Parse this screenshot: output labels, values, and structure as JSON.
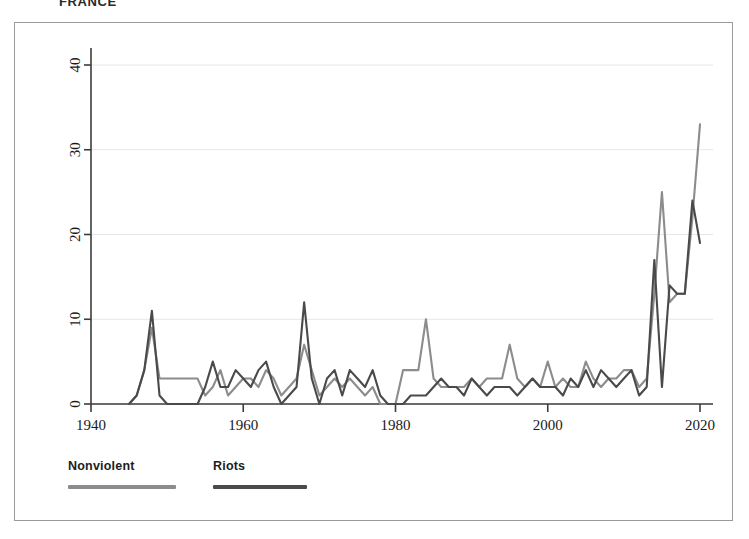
{
  "title": "FRANCE",
  "legend": {
    "items": [
      {
        "label": "Nonviolent",
        "color": "#8c8c8c"
      },
      {
        "label": "Riots",
        "color": "#4a4a4a"
      }
    ]
  },
  "axes": {
    "x_ticks": [
      "1940",
      "1960",
      "1980",
      "2000",
      "2020"
    ],
    "y_ticks": [
      "0",
      "10",
      "20",
      "30",
      "40"
    ]
  },
  "chart_data": {
    "type": "line",
    "title": "FRANCE",
    "xlabel": "",
    "ylabel": "",
    "xlim": [
      1940,
      2022
    ],
    "ylim": [
      0,
      43
    ],
    "grid": true,
    "legend_position": "below-plot-left",
    "x": [
      1945,
      1946,
      1947,
      1948,
      1949,
      1950,
      1951,
      1952,
      1953,
      1954,
      1955,
      1956,
      1957,
      1958,
      1959,
      1960,
      1961,
      1962,
      1963,
      1964,
      1965,
      1966,
      1967,
      1968,
      1969,
      1970,
      1971,
      1972,
      1973,
      1974,
      1975,
      1976,
      1977,
      1978,
      1979,
      1980,
      1981,
      1982,
      1983,
      1984,
      1985,
      1986,
      1987,
      1988,
      1989,
      1990,
      1991,
      1992,
      1993,
      1994,
      1995,
      1996,
      1997,
      1998,
      1999,
      2000,
      2001,
      2002,
      2003,
      2004,
      2005,
      2006,
      2007,
      2008,
      2009,
      2010,
      2011,
      2012,
      2013,
      2014,
      2015,
      2016,
      2017,
      2018,
      2019,
      2020
    ],
    "series": [
      {
        "name": "Nonviolent",
        "color": "#8c8c8c",
        "values": [
          0,
          1,
          4,
          9,
          3,
          3,
          3,
          3,
          3,
          3,
          1,
          2,
          4,
          1,
          2,
          3,
          3,
          2,
          4,
          3,
          1,
          2,
          3,
          7,
          4,
          1,
          2,
          3,
          2,
          3,
          2,
          1,
          2,
          0,
          0,
          0,
          4,
          4,
          4,
          10,
          3,
          2,
          2,
          2,
          2,
          3,
          2,
          3,
          3,
          3,
          7,
          3,
          2,
          3,
          2,
          5,
          2,
          3,
          2,
          2,
          5,
          3,
          2,
          3,
          3,
          4,
          4,
          2,
          3,
          13,
          25,
          12,
          13,
          13,
          22,
          33
        ]
      },
      {
        "name": "Riots",
        "color": "#4a4a4a",
        "values": [
          0,
          1,
          4,
          11,
          1,
          0,
          0,
          0,
          0,
          0,
          2,
          5,
          2,
          2,
          4,
          3,
          2,
          4,
          5,
          2,
          0,
          1,
          2,
          12,
          3,
          0,
          3,
          4,
          1,
          4,
          3,
          2,
          4,
          1,
          0,
          0,
          0,
          1,
          1,
          1,
          2,
          3,
          2,
          2,
          1,
          3,
          2,
          1,
          2,
          2,
          2,
          1,
          2,
          3,
          2,
          2,
          2,
          1,
          3,
          2,
          4,
          2,
          4,
          3,
          2,
          3,
          4,
          1,
          2,
          17,
          2,
          14,
          13,
          13,
          24,
          19
        ]
      }
    ]
  }
}
